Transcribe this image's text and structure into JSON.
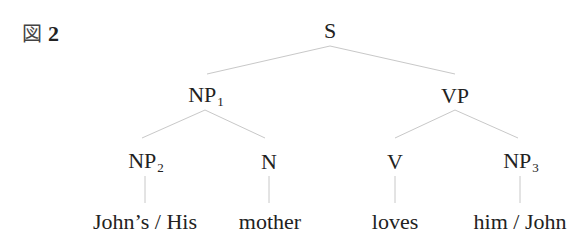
{
  "figure": {
    "label_prefix": "図",
    "label_number": "2"
  },
  "tree": {
    "root": {
      "label": "S",
      "sub": ""
    },
    "np1": {
      "label": "NP",
      "sub": "1"
    },
    "vp": {
      "label": "VP",
      "sub": ""
    },
    "np2": {
      "label": "NP",
      "sub": "2"
    },
    "n": {
      "label": "N",
      "sub": ""
    },
    "v": {
      "label": "V",
      "sub": ""
    },
    "np3": {
      "label": "NP",
      "sub": "3"
    },
    "leaves": {
      "np2": "John’s / His",
      "n": "mother",
      "v": "loves",
      "np3": "him / John"
    }
  },
  "colors": {
    "edge": "#c8c8c8",
    "text": "#222222"
  }
}
